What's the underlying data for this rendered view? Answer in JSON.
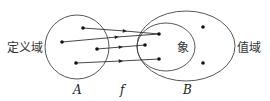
{
  "labels": {
    "domain": "定义域",
    "codomain": "值域",
    "image": "象",
    "set_a": "A",
    "set_b": "B",
    "mapping": "f"
  },
  "colors": {
    "stroke": "#444444",
    "text": "#333333"
  }
}
